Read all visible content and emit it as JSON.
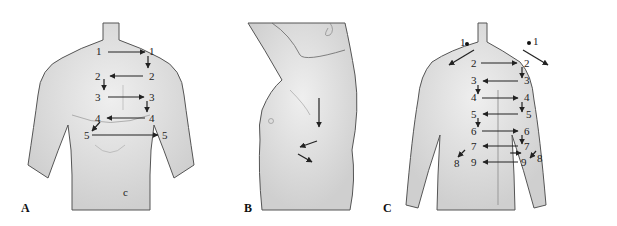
{
  "figure": {
    "panels": [
      {
        "letter": "A",
        "view": "anterior chest",
        "labels": [
          "1",
          "1",
          "2",
          "2",
          "3",
          "3",
          "4",
          "4",
          "5",
          "5"
        ]
      },
      {
        "letter": "B",
        "view": "lateral chest (arm raised)",
        "labels": []
      },
      {
        "letter": "C",
        "view": "posterior chest",
        "labels": [
          "1",
          "1",
          "2",
          "2",
          "3",
          "3",
          "4",
          "4",
          "5",
          "5",
          "6",
          "6",
          "7",
          "7",
          "8",
          "8",
          "9",
          "9"
        ]
      }
    ],
    "colors": {
      "skin": "#d9d9d9",
      "skin_highlight": "#efefef",
      "outline": "#555555",
      "arrow": "#222222",
      "background": "#ffffff"
    }
  }
}
